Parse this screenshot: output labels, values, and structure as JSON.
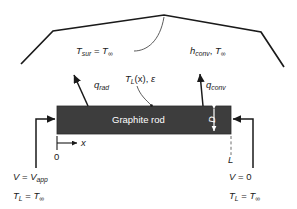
{
  "figure": {
    "colors": {
      "rod_fill": "#3d3d3d",
      "line": "#1a1a1a",
      "rod_text": "#ffffff",
      "background": "#ffffff"
    }
  },
  "surroundings": {
    "temperature_label": "T",
    "temperature_sub": "sur",
    "equals": " = ",
    "temperature_value": "T",
    "temperature_value_sub": "∞",
    "full_text": "T_sur = T_∞"
  },
  "convection": {
    "coefficient": "h",
    "coefficient_sub": "conv",
    "separator": ", ",
    "temperature": "T",
    "temperature_sub": "∞",
    "full_text": "h_conv, T_∞"
  },
  "fluxes": {
    "radiation": {
      "symbol": "q",
      "sub": "rad",
      "full_text": "q_rad"
    },
    "convection": {
      "symbol": "q",
      "sub": "conv",
      "full_text": "q_conv"
    }
  },
  "rod": {
    "label": "Graphite rod",
    "diameter_symbol": "D",
    "temperature_field": "T",
    "temperature_field_sub": "L",
    "temperature_field_arg": "(x)",
    "emissivity_separator": ", ",
    "emissivity": "ε",
    "temperature_field_full": "T_L(x), ε"
  },
  "axis": {
    "variable": "x",
    "origin": "0",
    "length": "L"
  },
  "boundary_left": {
    "voltage_symbol": "V",
    "voltage_equals": " = ",
    "voltage_value": "V",
    "voltage_value_sub": "app",
    "voltage_full": "V = V_app",
    "temperature_symbol": "T",
    "temperature_sub": "L",
    "temperature_equals": " = ",
    "temperature_value": "T",
    "temperature_value_sub": "∞",
    "temperature_full": "T_L = T_∞"
  },
  "boundary_right": {
    "voltage_symbol": "V",
    "voltage_equals": " = ",
    "voltage_value": "0",
    "voltage_full": "V = 0",
    "temperature_symbol": "T",
    "temperature_sub": "L",
    "temperature_equals": " = ",
    "temperature_value": "T",
    "temperature_value_sub": "∞",
    "temperature_full": "T_L = T_∞"
  }
}
